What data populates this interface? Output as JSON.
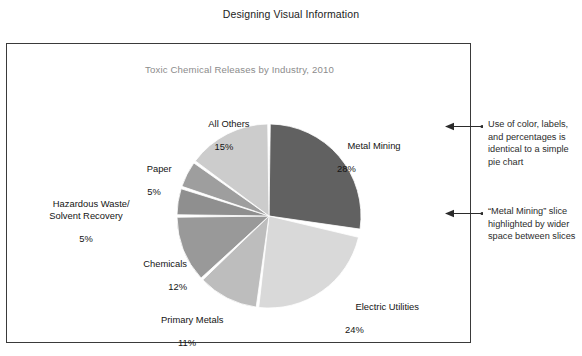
{
  "page": {
    "heading": "Designing Visual Information"
  },
  "figure": {
    "chart_title": "Toxic Chemical Releases by Industry, 2010"
  },
  "annotations": [
    {
      "id": "annotation-color-labels",
      "text": "Use of color, labels, and percentages is identical to a simple pie chart",
      "arrow_icon": "left-arrow-icon"
    },
    {
      "id": "annotation-highlight-gap",
      "text": "“Metal Mining” slice highlighted by wider space between slices",
      "arrow_icon": "left-arrow-icon"
    }
  ],
  "labels": {
    "all_others": {
      "name": "All Others",
      "pct": "15%"
    },
    "metal_mining": {
      "name": "Metal Mining",
      "pct": "28%"
    },
    "electric_utilities": {
      "name": "Electric Utilities",
      "pct": "24%"
    },
    "primary_metals": {
      "name": "Primary Metals",
      "pct": "11%"
    },
    "chemicals": {
      "name": "Chemicals",
      "pct": "12%"
    },
    "hazardous_waste": {
      "name": "Hazardous Waste/\nSolvent Recovery",
      "pct": "5%"
    },
    "paper": {
      "name": "Paper",
      "pct": "5%"
    }
  },
  "chart_data": {
    "type": "pie",
    "title": "Toxic Chemical Releases by Industry, 2010",
    "xlabel": "",
    "ylabel": "",
    "legend": "none (direct slice labels)",
    "grid": false,
    "start_angle_deg": 0,
    "direction": "clockwise",
    "units": "percent",
    "total": 100,
    "exploded_gap_slice": "Metal Mining",
    "categories": [
      "Metal Mining",
      "Electric Utilities",
      "Primary Metals",
      "Chemicals",
      "Hazardous Waste/Solvent Recovery",
      "Paper",
      "All Others"
    ],
    "values": [
      28,
      24,
      11,
      12,
      5,
      5,
      15
    ],
    "colors": [
      "#616161",
      "#d9d9d9",
      "#bdbdbd",
      "#999999",
      "#8f8f8f",
      "#9e9e9e",
      "#cccccc"
    ],
    "slices": [
      {
        "label": "Metal Mining",
        "value": 28,
        "color": "#616161"
      },
      {
        "label": "Electric Utilities",
        "value": 24,
        "color": "#d9d9d9"
      },
      {
        "label": "Primary Metals",
        "value": 11,
        "color": "#bdbdbd"
      },
      {
        "label": "Chemicals",
        "value": 12,
        "color": "#999999"
      },
      {
        "label": "Hazardous Waste/Solvent Recovery",
        "value": 5,
        "color": "#8f8f8f"
      },
      {
        "label": "Paper",
        "value": 5,
        "color": "#9e9e9e"
      },
      {
        "label": "All Others",
        "value": 15,
        "color": "#cccccc"
      }
    ]
  },
  "colors": {
    "frame_border": "#3a3a3a",
    "chart_title": "#8c8c8c",
    "text": "#141414",
    "background": "#ffffff"
  }
}
